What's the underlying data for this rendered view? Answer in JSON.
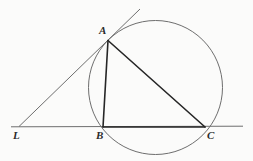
{
  "figure": {
    "background_color": "#fbfbfa",
    "stroke_color_heavy": "#262626",
    "stroke_color_light": "#6e6e6e",
    "canvas": {
      "width": 253,
      "height": 161
    }
  },
  "labels": {
    "A": "A",
    "B": "B",
    "C": "C",
    "L": "L"
  },
  "points": {
    "A": {
      "x": 108,
      "y": 40.5
    },
    "B": {
      "x": 103,
      "y": 127
    },
    "C": {
      "x": 205,
      "y": 127
    },
    "L": {
      "x": 19,
      "y": 126.5
    }
  },
  "circle": {
    "cx": 155.5,
    "cy": 87.5,
    "r": 67,
    "stroke": "#6e6e6e",
    "stroke_width": 1
  },
  "segments": [
    {
      "name": "chord-AB",
      "x1": 108,
      "y1": 40.5,
      "x2": 103,
      "y2": 127,
      "stroke": "#262626",
      "stroke_width": 1.6
    },
    {
      "name": "chord-AC",
      "x1": 108,
      "y1": 40.5,
      "x2": 205,
      "y2": 127,
      "stroke": "#262626",
      "stroke_width": 1.6
    },
    {
      "name": "chord-BC",
      "x1": 103,
      "y1": 127,
      "x2": 205,
      "y2": 127,
      "stroke": "#262626",
      "stroke_width": 1.6
    },
    {
      "name": "tangent-line-LA",
      "x1": 19,
      "y1": 126.5,
      "x2": 140,
      "y2": 9,
      "stroke": "#6e6e6e",
      "stroke_width": 1
    },
    {
      "name": "secant-line-LC",
      "x1": 11,
      "y1": 126.8,
      "x2": 243,
      "y2": 126.2,
      "stroke": "#6e6e6e",
      "stroke_width": 1
    }
  ]
}
